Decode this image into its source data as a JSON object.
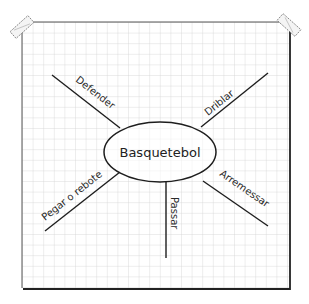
{
  "diagram": {
    "type": "mind-map",
    "background": "graph-paper",
    "center": {
      "label": "Basquetebol"
    },
    "branches": [
      {
        "label": "Defender"
      },
      {
        "label": "Driblar"
      },
      {
        "label": "Pegar o rebote"
      },
      {
        "label": "Passar"
      },
      {
        "label": "Arremessar"
      }
    ]
  },
  "colors": {
    "paper": "#ffffff",
    "grid": "#d4d4d4",
    "ink": "#1e1e1e",
    "tape_fill": "#f4f4f4",
    "tape_stroke": "#777777"
  }
}
